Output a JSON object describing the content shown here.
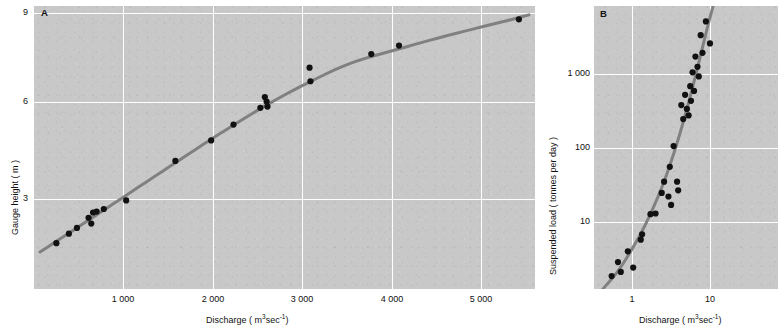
{
  "figure": {
    "background_color": "#ffffff",
    "plot_background_color": "#c8c8c8",
    "grid_color": "#ffffff",
    "curve_color": "#808080",
    "point_color": "#111111"
  },
  "panels": {
    "a": {
      "letter": "A",
      "xlabel_main": "Discharge ( m",
      "xlabel_sup": "3",
      "xlabel_mid": "sec",
      "xlabel_sup2": "-1",
      "xlabel_end": ")",
      "ylabel": "Gauge height ( m )",
      "xticks": [
        "1 000",
        "2 000",
        "3 000",
        "4 000",
        "5 000"
      ],
      "yticks": [
        "9",
        "6",
        "3"
      ]
    },
    "b": {
      "letter": "B",
      "xlabel_main": "Discharge ( m",
      "xlabel_sup": "3",
      "xlabel_mid": "sec",
      "xlabel_sup2": "-1",
      "xlabel_end": ")",
      "ylabel": "Suspended load ( tonnes per day )",
      "xticks": [
        "1",
        "10"
      ],
      "yticks": [
        "1 000",
        "100",
        "10"
      ]
    }
  },
  "chart_data": [
    {
      "type": "scatter",
      "id": "panel-a",
      "title": "A",
      "xlabel": "Discharge ( m3 sec-1 )",
      "ylabel": "Gauge height ( m )",
      "xscale": "linear",
      "yscale": "linear",
      "xlim": [
        0,
        5600
      ],
      "ylim": [
        0.35,
        9.3
      ],
      "xticks": [
        1000,
        2000,
        3000,
        4000,
        5000
      ],
      "yticks": [
        3,
        6,
        9
      ],
      "grid": true,
      "legend": "none",
      "description": "Stage-discharge rating curve; gauge height rises with discharge following a concave-down power relation.",
      "points": [
        {
          "x": 250,
          "y": 1.8
        },
        {
          "x": 390,
          "y": 2.1
        },
        {
          "x": 480,
          "y": 2.28
        },
        {
          "x": 610,
          "y": 2.6
        },
        {
          "x": 640,
          "y": 2.42
        },
        {
          "x": 660,
          "y": 2.77
        },
        {
          "x": 700,
          "y": 2.8
        },
        {
          "x": 780,
          "y": 2.88
        },
        {
          "x": 1030,
          "y": 3.15
        },
        {
          "x": 1580,
          "y": 4.4
        },
        {
          "x": 1980,
          "y": 5.05
        },
        {
          "x": 2230,
          "y": 5.55
        },
        {
          "x": 2530,
          "y": 6.08
        },
        {
          "x": 2580,
          "y": 6.42
        },
        {
          "x": 2600,
          "y": 6.28
        },
        {
          "x": 2610,
          "y": 6.12
        },
        {
          "x": 3080,
          "y": 7.35
        },
        {
          "x": 3090,
          "y": 6.92
        },
        {
          "x": 3770,
          "y": 7.78
        },
        {
          "x": 4080,
          "y": 8.05
        },
        {
          "x": 5420,
          "y": 8.88
        }
      ],
      "fit_curve": {
        "style": "solid",
        "color": "#808080",
        "width_px": 3,
        "note": "Smooth concave-down rating curve fitted through the points"
      }
    },
    {
      "type": "scatter",
      "id": "panel-b",
      "title": "B",
      "xlabel": "Discharge ( m3 sec-1 )",
      "ylabel": "Suspended load ( tonnes per day )",
      "xscale": "log",
      "yscale": "log",
      "xlim": [
        0.45,
        45
      ],
      "ylim": [
        3.8,
        5500
      ],
      "xticks": [
        1,
        10
      ],
      "yticks": [
        10,
        100,
        1000
      ],
      "grid": true,
      "legend": "none",
      "description": "Sediment rating curve; suspended load increases as a power function of discharge on log-log axes.",
      "points": [
        {
          "x": 0.7,
          "y": 5.3
        },
        {
          "x": 0.82,
          "y": 7.6
        },
        {
          "x": 0.88,
          "y": 5.9
        },
        {
          "x": 1.05,
          "y": 10.0
        },
        {
          "x": 1.2,
          "y": 6.6
        },
        {
          "x": 1.45,
          "y": 13.5
        },
        {
          "x": 1.5,
          "y": 15.5
        },
        {
          "x": 1.85,
          "y": 26.0
        },
        {
          "x": 2.1,
          "y": 26.5
        },
        {
          "x": 2.45,
          "y": 45.0
        },
        {
          "x": 2.6,
          "y": 60.0
        },
        {
          "x": 2.9,
          "y": 41.0
        },
        {
          "x": 3.0,
          "y": 88.0
        },
        {
          "x": 3.1,
          "y": 33.0
        },
        {
          "x": 3.3,
          "y": 150.0
        },
        {
          "x": 3.6,
          "y": 60.0
        },
        {
          "x": 3.7,
          "y": 48.0
        },
        {
          "x": 4.0,
          "y": 430.0
        },
        {
          "x": 4.2,
          "y": 300.0
        },
        {
          "x": 4.4,
          "y": 560.0
        },
        {
          "x": 4.6,
          "y": 390.0
        },
        {
          "x": 4.8,
          "y": 330.0
        },
        {
          "x": 5.0,
          "y": 700.0
        },
        {
          "x": 5.1,
          "y": 480.0
        },
        {
          "x": 5.3,
          "y": 1000.0
        },
        {
          "x": 5.5,
          "y": 620.0
        },
        {
          "x": 5.7,
          "y": 1500.0
        },
        {
          "x": 6.0,
          "y": 1150.0
        },
        {
          "x": 6.2,
          "y": 900.0
        },
        {
          "x": 6.5,
          "y": 2600.0
        },
        {
          "x": 6.8,
          "y": 1650.0
        },
        {
          "x": 7.4,
          "y": 3700.0
        },
        {
          "x": 8.2,
          "y": 2100.0
        }
      ],
      "fit_curve": {
        "style": "solid",
        "color": "#808080",
        "width_px": 3,
        "note": "Straight power-law line on log-log axes through the cloud of points"
      }
    }
  ]
}
